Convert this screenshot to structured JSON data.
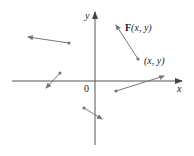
{
  "diagram": {
    "axes": {
      "x_label": "x",
      "y_label": "y",
      "origin_label": "0",
      "x_axis": {
        "x1": 12,
        "x2": 182,
        "y": 81
      },
      "y_axis": {
        "x": 95,
        "y1": 145,
        "y2": 12
      },
      "color": "#555555"
    },
    "vectors": [
      {
        "tail": [
          69,
          43
        ],
        "head": [
          28,
          37
        ]
      },
      {
        "tail": [
          60,
          73
        ],
        "head": [
          46,
          88
        ]
      },
      {
        "tail": [
          116,
          91
        ],
        "head": [
          164,
          76
        ]
      },
      {
        "tail": [
          84,
          108
        ],
        "head": [
          102,
          119
        ]
      },
      {
        "tail": [
          138,
          59
        ],
        "head": [
          116,
          25
        ]
      }
    ],
    "vector_color": "#777777",
    "annotations": {
      "field_label_bold": "F",
      "field_label_rest": "(x, y)",
      "point_label": "(x, y)"
    }
  }
}
